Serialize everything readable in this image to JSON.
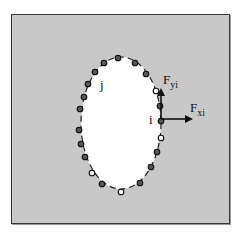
{
  "diagram": {
    "colors": {
      "background": "#ffffff",
      "plate": "#c8c8c8",
      "hole": "#ffffff",
      "frame": "#3a3a3a",
      "boundary": "#222222",
      "node_filled": "#555555",
      "node_open": "#ffffff",
      "arrow": "#111111"
    },
    "ellipse": {
      "cx": 121,
      "cy": 121,
      "rx": 40,
      "ry": 66
    },
    "labels": {
      "node_j": "j",
      "node_i": "i",
      "force_y_main": "F",
      "force_y_sub": "yi",
      "force_x_main": "F",
      "force_x_sub": "xi"
    },
    "nodes": [
      {
        "x": 118,
        "y": 56,
        "type": "filled"
      },
      {
        "x": 135,
        "y": 61,
        "type": "filled"
      },
      {
        "x": 146,
        "y": 72,
        "type": "filled"
      },
      {
        "x": 156,
        "y": 89,
        "type": "open"
      },
      {
        "x": 160,
        "y": 104,
        "type": "filled"
      },
      {
        "x": 161,
        "y": 119,
        "type": "filled"
      },
      {
        "x": 161,
        "y": 136,
        "type": "open"
      },
      {
        "x": 157,
        "y": 150,
        "type": "filled"
      },
      {
        "x": 151,
        "y": 165,
        "type": "filled"
      },
      {
        "x": 140,
        "y": 181,
        "type": "filled"
      },
      {
        "x": 121,
        "y": 190,
        "type": "open"
      },
      {
        "x": 102,
        "y": 182,
        "type": "filled"
      },
      {
        "x": 92,
        "y": 171,
        "type": "open"
      },
      {
        "x": 85,
        "y": 155,
        "type": "filled"
      },
      {
        "x": 81,
        "y": 142,
        "type": "filled"
      },
      {
        "x": 79,
        "y": 128,
        "type": "filled"
      },
      {
        "x": 80,
        "y": 107,
        "type": "filled"
      },
      {
        "x": 84,
        "y": 95,
        "type": "filled"
      },
      {
        "x": 88,
        "y": 82,
        "type": "filled"
      },
      {
        "x": 95,
        "y": 70,
        "type": "filled"
      },
      {
        "x": 104,
        "y": 61,
        "type": "filled"
      }
    ]
  }
}
